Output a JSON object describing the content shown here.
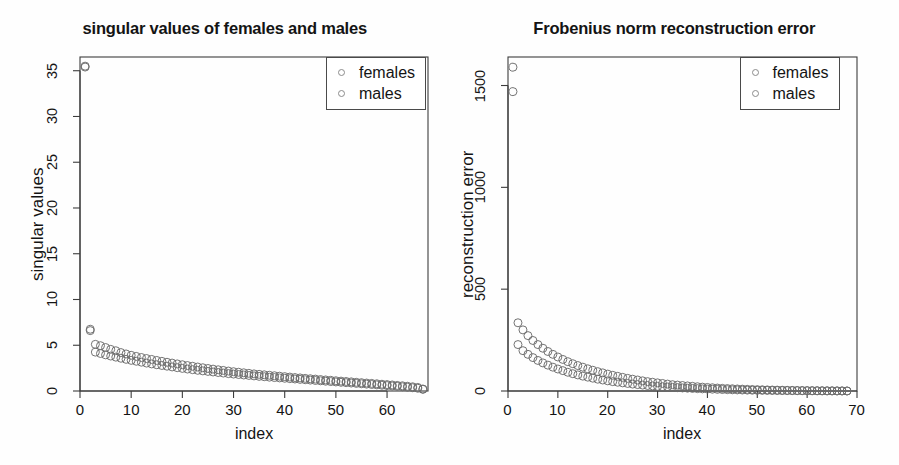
{
  "figure": {
    "width": 899,
    "height": 465,
    "background": "#ffffff",
    "marker_color": "#6b6b6b",
    "axis_color": "#3c3c3c"
  },
  "chart_data": [
    {
      "type": "scatter",
      "panel": "left",
      "title": "singular values of females and males",
      "xlabel": "index",
      "ylabel": "singular values",
      "xlim": [
        0,
        68
      ],
      "ylim": [
        0,
        36.5
      ],
      "xticks": [
        0,
        10,
        20,
        30,
        40,
        50,
        60
      ],
      "yticks": [
        0,
        5,
        10,
        15,
        20,
        25,
        30,
        35
      ],
      "grid": false,
      "legend_position": "top-right",
      "legend": [
        "females",
        "males"
      ],
      "series": [
        {
          "name": "females",
          "x": [
            1,
            2,
            3,
            4,
            5,
            6,
            7,
            8,
            9,
            10,
            11,
            12,
            13,
            14,
            15,
            16,
            17,
            18,
            19,
            20,
            21,
            22,
            23,
            24,
            25,
            26,
            27,
            28,
            29,
            30,
            31,
            32,
            33,
            34,
            35,
            36,
            37,
            38,
            39,
            40,
            41,
            42,
            43,
            44,
            45,
            46,
            47,
            48,
            49,
            50,
            51,
            52,
            53,
            54,
            55,
            56,
            57,
            58,
            59,
            60,
            61,
            62,
            63,
            64,
            65,
            66,
            67
          ],
          "y": [
            35.5,
            6.75,
            5.1,
            4.95,
            4.75,
            4.55,
            4.4,
            4.2,
            4.05,
            3.9,
            3.78,
            3.66,
            3.55,
            3.45,
            3.34,
            3.24,
            3.14,
            3.05,
            2.96,
            2.87,
            2.78,
            2.7,
            2.62,
            2.54,
            2.46,
            2.39,
            2.32,
            2.25,
            2.18,
            2.11,
            2.05,
            1.99,
            1.93,
            1.87,
            1.82,
            1.77,
            1.72,
            1.67,
            1.62,
            1.57,
            1.52,
            1.47,
            1.43,
            1.38,
            1.34,
            1.3,
            1.25,
            1.21,
            1.17,
            1.12,
            1.08,
            1.04,
            1.0,
            0.95,
            0.91,
            0.87,
            0.83,
            0.79,
            0.74,
            0.7,
            0.66,
            0.61,
            0.57,
            0.52,
            0.46,
            0.39,
            0.22
          ]
        },
        {
          "name": "males",
          "x": [
            1,
            2,
            3,
            4,
            5,
            6,
            7,
            8,
            9,
            10,
            11,
            12,
            13,
            14,
            15,
            16,
            17,
            18,
            19,
            20,
            21,
            22,
            23,
            24,
            25,
            26,
            27,
            28,
            29,
            30,
            31,
            32,
            33,
            34,
            35,
            36,
            37,
            38,
            39,
            40,
            41,
            42,
            43,
            44,
            45,
            46,
            47,
            48,
            49,
            50,
            51,
            52,
            53,
            54,
            55,
            56,
            57,
            58,
            59,
            60,
            61,
            62,
            63,
            64,
            65,
            66,
            67
          ],
          "y": [
            35.4,
            6.6,
            4.25,
            4.1,
            3.95,
            3.82,
            3.7,
            3.58,
            3.46,
            3.35,
            3.25,
            3.15,
            3.05,
            2.96,
            2.87,
            2.79,
            2.71,
            2.63,
            2.55,
            2.47,
            2.4,
            2.33,
            2.26,
            2.2,
            2.14,
            2.08,
            2.02,
            1.96,
            1.9,
            1.85,
            1.8,
            1.75,
            1.7,
            1.65,
            1.6,
            1.56,
            1.51,
            1.47,
            1.43,
            1.39,
            1.35,
            1.31,
            1.27,
            1.23,
            1.19,
            1.15,
            1.11,
            1.07,
            1.03,
            0.99,
            0.95,
            0.91,
            0.87,
            0.83,
            0.79,
            0.75,
            0.71,
            0.67,
            0.63,
            0.59,
            0.55,
            0.51,
            0.46,
            0.41,
            0.36,
            0.3,
            0.18
          ]
        }
      ]
    },
    {
      "type": "scatter",
      "panel": "right",
      "title": "Frobenius norm reconstruction error",
      "xlabel": "index",
      "ylabel": "reconstruction error",
      "xlim": [
        0,
        70
      ],
      "ylim": [
        0,
        1640
      ],
      "xticks": [
        0,
        10,
        20,
        30,
        40,
        50,
        60,
        70
      ],
      "yticks": [
        0,
        500,
        1000,
        1500
      ],
      "grid": false,
      "legend_position": "top-right",
      "legend": [
        "females",
        "males"
      ],
      "series": [
        {
          "name": "females",
          "x": [
            1,
            2,
            3,
            4,
            5,
            6,
            7,
            8,
            9,
            10,
            11,
            12,
            13,
            14,
            15,
            16,
            17,
            18,
            19,
            20,
            21,
            22,
            23,
            24,
            25,
            26,
            27,
            28,
            29,
            30,
            31,
            32,
            33,
            34,
            35,
            36,
            37,
            38,
            39,
            40,
            41,
            42,
            43,
            44,
            45,
            46,
            47,
            48,
            49,
            50,
            51,
            52,
            53,
            54,
            55,
            56,
            57,
            58,
            59,
            60,
            61,
            62,
            63,
            64,
            65,
            66,
            67,
            68
          ],
          "y": [
            1590,
            335,
            300,
            272,
            248,
            228,
            210,
            194,
            180,
            167,
            155,
            144,
            134,
            125,
            117,
            109,
            102,
            95,
            89,
            83,
            77,
            72,
            67,
            62,
            58,
            54,
            50,
            46,
            43,
            40,
            37,
            34,
            31,
            29,
            27,
            25,
            23,
            21,
            19,
            17.5,
            16,
            14.5,
            13,
            12,
            11,
            10,
            9,
            8.2,
            7.4,
            6.7,
            6,
            5.4,
            4.8,
            4.3,
            3.8,
            3.4,
            3,
            2.6,
            2.3,
            2,
            1.7,
            1.5,
            1.2,
            1,
            0.8,
            0.6,
            0.4,
            0.2
          ]
        },
        {
          "name": "males",
          "x": [
            1,
            2,
            3,
            4,
            5,
            6,
            7,
            8,
            9,
            10,
            11,
            12,
            13,
            14,
            15,
            16,
            17,
            18,
            19,
            20,
            21,
            22,
            23,
            24,
            25,
            26,
            27,
            28,
            29,
            30,
            31,
            32,
            33,
            34,
            35,
            36,
            37,
            38,
            39,
            40,
            41,
            42,
            43,
            44,
            45,
            46,
            47,
            48,
            49,
            50,
            51,
            52,
            53,
            54,
            55,
            56,
            57,
            58,
            59,
            60,
            61,
            62,
            63,
            64,
            65,
            66,
            67,
            68
          ],
          "y": [
            1470,
            228,
            198,
            180,
            164,
            150,
            138,
            127,
            117,
            108,
            100,
            92,
            85,
            79,
            73,
            68,
            63,
            58,
            54,
            50,
            46,
            43,
            40,
            37,
            34,
            31.5,
            29,
            27,
            25,
            23,
            21,
            19.5,
            18,
            16.5,
            15,
            13.8,
            12.6,
            11.5,
            10.5,
            9.6,
            8.8,
            8,
            7.2,
            6.5,
            5.9,
            5.3,
            4.8,
            4.3,
            3.9,
            3.5,
            3.1,
            2.8,
            2.5,
            2.2,
            2,
            1.8,
            1.6,
            1.4,
            1.2,
            1.05,
            0.9,
            0.78,
            0.66,
            0.55,
            0.45,
            0.35,
            0.25,
            0.15
          ]
        }
      ]
    }
  ]
}
